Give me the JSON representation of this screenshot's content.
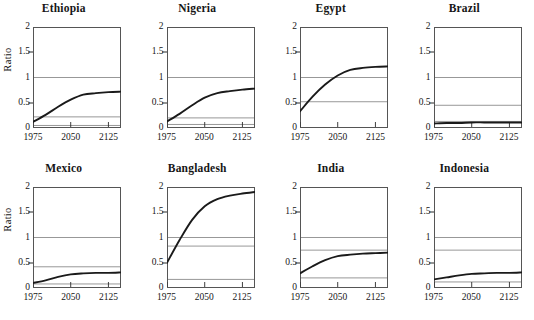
{
  "figure": {
    "ylabel": "Ratio",
    "yticks": [
      "0",
      "0.5",
      "1",
      "1.5",
      "2"
    ],
    "ytick_values": [
      0,
      0.5,
      1,
      1.5,
      2
    ],
    "xticks": [
      "1975",
      "2050",
      "2125"
    ],
    "xtick_values": [
      1975,
      2050,
      2125
    ],
    "line_color": "#1a1a1a",
    "reference_line_color": "#8c8c8c",
    "frame_color": "#555555"
  },
  "chart_data": {
    "type": "line",
    "title": "",
    "xlabel": "",
    "ylabel": "Ratio",
    "xlim": [
      1975,
      2150
    ],
    "ylim": [
      0,
      2
    ],
    "grid": false,
    "legend": "none",
    "panels": [
      {
        "name": "Ethiopia",
        "x": [
          1975,
          2000,
          2025,
          2050,
          2075,
          2100,
          2125,
          2150
        ],
        "values": [
          0.12,
          0.26,
          0.42,
          0.56,
          0.66,
          0.69,
          0.71,
          0.72
        ],
        "reference_lines": [
          1.0,
          0.22,
          0.05
        ]
      },
      {
        "name": "Nigeria",
        "x": [
          1975,
          2000,
          2025,
          2050,
          2075,
          2100,
          2125,
          2150
        ],
        "values": [
          0.13,
          0.28,
          0.45,
          0.6,
          0.69,
          0.73,
          0.76,
          0.78
        ],
        "reference_lines": [
          1.0,
          0.2,
          0.07
        ]
      },
      {
        "name": "Egypt",
        "x": [
          1975,
          2000,
          2025,
          2050,
          2075,
          2100,
          2125,
          2150
        ],
        "values": [
          0.33,
          0.62,
          0.86,
          1.04,
          1.15,
          1.19,
          1.21,
          1.22
        ],
        "reference_lines": [
          1.0,
          0.52
        ]
      },
      {
        "name": "Brazil",
        "x": [
          1975,
          2000,
          2025,
          2050,
          2075,
          2100,
          2125,
          2150
        ],
        "values": [
          0.09,
          0.1,
          0.1,
          0.11,
          0.11,
          0.11,
          0.11,
          0.11
        ],
        "reference_lines": [
          1.0,
          0.45,
          0.13
        ]
      },
      {
        "name": "Mexico",
        "x": [
          1975,
          2000,
          2025,
          2050,
          2075,
          2100,
          2125,
          2150
        ],
        "values": [
          0.1,
          0.15,
          0.22,
          0.27,
          0.29,
          0.3,
          0.3,
          0.31
        ],
        "reference_lines": [
          1.0,
          0.42,
          0.08
        ]
      },
      {
        "name": "Bangladesh",
        "x": [
          1975,
          2000,
          2025,
          2050,
          2075,
          2100,
          2125,
          2150
        ],
        "values": [
          0.5,
          0.95,
          1.35,
          1.62,
          1.76,
          1.83,
          1.87,
          1.9
        ],
        "reference_lines": [
          1.0,
          0.83,
          0.17
        ]
      },
      {
        "name": "India",
        "x": [
          1975,
          2000,
          2025,
          2050,
          2075,
          2100,
          2125,
          2150
        ],
        "values": [
          0.29,
          0.43,
          0.55,
          0.63,
          0.66,
          0.68,
          0.69,
          0.7
        ],
        "reference_lines": [
          1.0,
          0.75,
          0.2
        ]
      },
      {
        "name": "Indonesia",
        "x": [
          1975,
          2000,
          2025,
          2050,
          2075,
          2100,
          2125,
          2150
        ],
        "values": [
          0.17,
          0.21,
          0.25,
          0.28,
          0.29,
          0.3,
          0.3,
          0.31
        ],
        "reference_lines": [
          1.0,
          0.75,
          0.12
        ]
      }
    ]
  }
}
